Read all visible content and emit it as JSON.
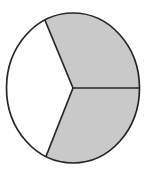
{
  "figure": {
    "name": "fraction-circle-diagram",
    "type": "pie",
    "title": "",
    "background_color": "#ffffff",
    "stroke_color": "#262626",
    "stroke_width": 1.7,
    "circle": {
      "center_x": 73,
      "center_y": 88,
      "radius_x": 66.5,
      "radius_y": 75
    },
    "sector_count": 3,
    "shaded_count": 2,
    "unshaded_count": 1,
    "fraction_label": "",
    "colors": {
      "shaded": "#c9c9c9",
      "unshaded": "#ffffff",
      "outline": "#262626"
    },
    "sectors": [
      {
        "id": "sector-upper-right",
        "label": "",
        "shaded": true,
        "fill": "#c9c9c9",
        "start_angle_deg": 0,
        "end_angle_deg": 115,
        "sweep_deg": 115
      },
      {
        "id": "sector-left",
        "label": "",
        "shaded": false,
        "fill": "#ffffff",
        "start_angle_deg": 115,
        "end_angle_deg": 246,
        "sweep_deg": 131
      },
      {
        "id": "sector-lower-right",
        "label": "",
        "shaded": true,
        "fill": "#c9c9c9",
        "start_angle_deg": 246,
        "end_angle_deg": 360,
        "sweep_deg": 114
      }
    ],
    "radii": [
      {
        "id": "radius-right",
        "angle_deg": 0,
        "end_x": 139.5,
        "end_y": 88
      },
      {
        "id": "radius-upper-left",
        "angle_deg": 115,
        "end_x": 44.9,
        "end_y": 20.0
      },
      {
        "id": "radius-lower-left",
        "angle_deg": 246,
        "end_x": 45.9,
        "end_y": 156.5
      }
    ]
  },
  "chart_data": {
    "type": "pie",
    "title": "",
    "categories": [
      "Shaded part A",
      "Unshaded part",
      "Shaded part B"
    ],
    "values": [
      115,
      131,
      114
    ],
    "value_unit": "degrees",
    "fractions": [
      "115/360",
      "131/360",
      "114/360"
    ],
    "colors": [
      "#c9c9c9",
      "#ffffff",
      "#c9c9c9"
    ],
    "legend": "none",
    "grid": false,
    "labels_shown": false
  }
}
